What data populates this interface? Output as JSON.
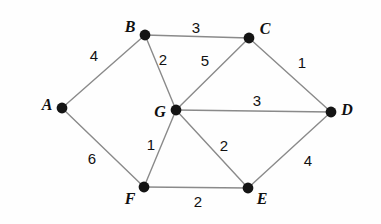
{
  "figure": {
    "background_color": "#fefefe",
    "edge_color": "#8a8a8a",
    "node_color": "#141414",
    "label_color": "#101010",
    "width": 381,
    "height": 224
  },
  "graph": {
    "type": "weighted-undirected-graph",
    "nodes": [
      {
        "id": "A",
        "label": "A",
        "x": 62,
        "y": 108,
        "label_x": 47,
        "label_y": 105
      },
      {
        "id": "B",
        "label": "B",
        "x": 145,
        "y": 35,
        "label_x": 130,
        "label_y": 27
      },
      {
        "id": "C",
        "label": "C",
        "x": 249,
        "y": 38,
        "label_x": 265,
        "label_y": 29
      },
      {
        "id": "D",
        "label": "D",
        "x": 331,
        "y": 112,
        "label_x": 347,
        "label_y": 110
      },
      {
        "id": "E",
        "label": "E",
        "x": 248,
        "y": 188,
        "label_x": 262,
        "label_y": 199
      },
      {
        "id": "F",
        "label": "F",
        "x": 144,
        "y": 187,
        "label_x": 130,
        "label_y": 199
      },
      {
        "id": "G",
        "label": "G",
        "x": 176,
        "y": 110,
        "label_x": 160,
        "label_y": 112
      }
    ],
    "edges": [
      {
        "from": "A",
        "to": "B",
        "weight": "4",
        "label_x": 94,
        "label_y": 55
      },
      {
        "from": "A",
        "to": "F",
        "weight": "6",
        "label_x": 92,
        "label_y": 158
      },
      {
        "from": "B",
        "to": "C",
        "weight": "3",
        "label_x": 196,
        "label_y": 27
      },
      {
        "from": "B",
        "to": "G",
        "weight": "2",
        "label_x": 163,
        "label_y": 59
      },
      {
        "from": "G",
        "to": "C",
        "weight": "5",
        "label_x": 205,
        "label_y": 60
      },
      {
        "from": "C",
        "to": "D",
        "weight": "1",
        "label_x": 302,
        "label_y": 62
      },
      {
        "from": "G",
        "to": "D",
        "weight": "3",
        "label_x": 257,
        "label_y": 100
      },
      {
        "from": "G",
        "to": "F",
        "weight": "1",
        "label_x": 151,
        "label_y": 144
      },
      {
        "from": "G",
        "to": "E",
        "weight": "2",
        "label_x": 224,
        "label_y": 145
      },
      {
        "from": "F",
        "to": "E",
        "weight": "2",
        "label_x": 198,
        "label_y": 201
      },
      {
        "from": "D",
        "to": "E",
        "weight": "4",
        "label_x": 308,
        "label_y": 160
      }
    ]
  }
}
